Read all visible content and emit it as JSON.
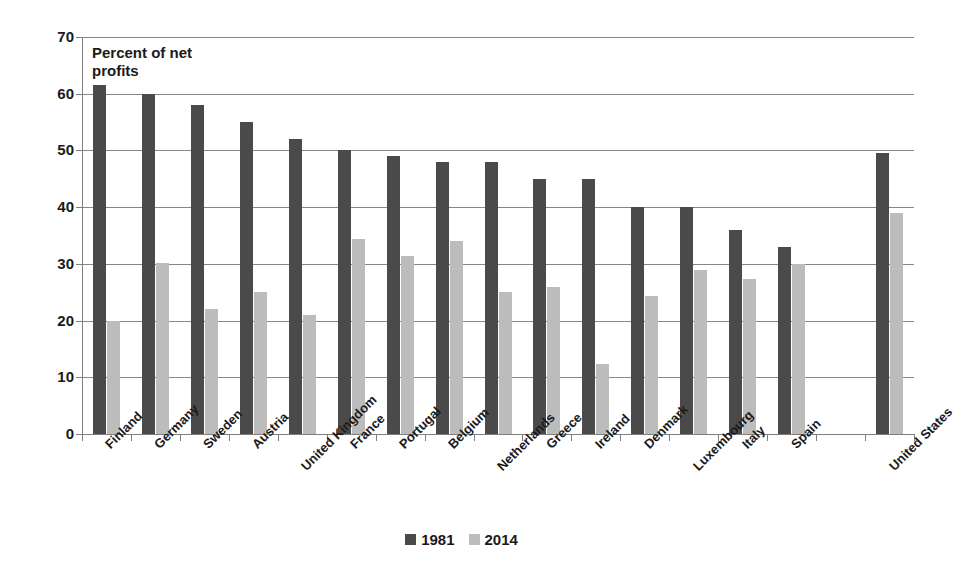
{
  "chart_data": {
    "type": "bar",
    "title": "",
    "subtitle": "",
    "annotation": "Percent of net profits",
    "xlabel": "",
    "ylabel": "Percent of net profits",
    "ylim": [
      0,
      70
    ],
    "y_ticks": [
      0,
      10,
      20,
      30,
      40,
      50,
      60,
      70
    ],
    "grid": true,
    "legend_position": "bottom-center",
    "categories": [
      "Finland",
      "Germany",
      "Sweden",
      "Austria",
      "United Kingdom",
      "France",
      "Portugal",
      "Belgium",
      "Netherlands",
      "Greece",
      "Ireland",
      "Denmark",
      "Luxembourg",
      "Italy",
      "Spain",
      "",
      "United States"
    ],
    "series": [
      {
        "name": "1981",
        "color": "#4a4a4a",
        "values": [
          61.5,
          60,
          58,
          55,
          52,
          50,
          49,
          48,
          48,
          45,
          45,
          40,
          40,
          36,
          33,
          null,
          49.5
        ]
      },
      {
        "name": "2014",
        "color": "#bcbcbc",
        "values": [
          20,
          30.2,
          22,
          25,
          21,
          34.3,
          31.3,
          34,
          25,
          26,
          12.3,
          24.3,
          29,
          27.3,
          30,
          null,
          39
        ]
      }
    ]
  },
  "legend": {
    "items": [
      {
        "label": "1981",
        "color": "#4a4a4a"
      },
      {
        "label": "2014",
        "color": "#bcbcbc"
      }
    ]
  },
  "axis": {
    "y_tick_labels": [
      "70",
      "60",
      "50",
      "40",
      "30",
      "20",
      "10",
      "0"
    ]
  }
}
